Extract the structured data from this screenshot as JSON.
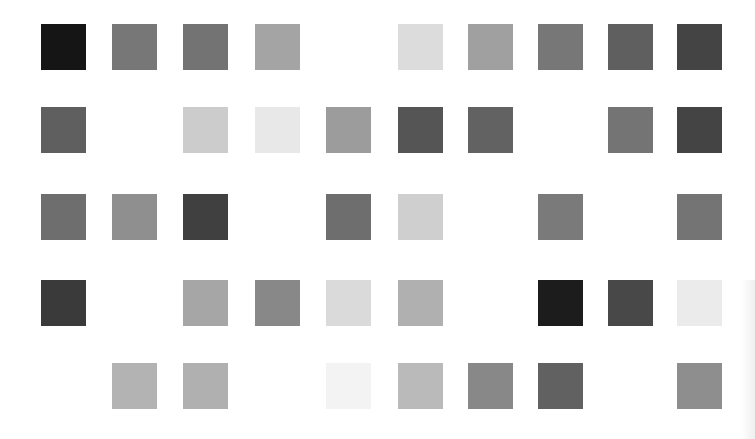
{
  "grid": {
    "rows": 5,
    "cols": 10,
    "cell_size": 45,
    "col_x": [
      41,
      112,
      183,
      255,
      326,
      398,
      468,
      538,
      608,
      677
    ],
    "row_y": [
      24,
      107,
      194,
      280,
      363
    ],
    "cells": [
      [
        "#151515",
        "#777777",
        "#737373",
        "#a4a4a4",
        null,
        "#dcdcdc",
        "#a0a0a0",
        "#777777",
        "#5f5f5f",
        "#444444"
      ],
      [
        "#5f5f5f",
        null,
        "#cccccc",
        "#e8e8e8",
        "#9c9c9c",
        "#555555",
        "#626262",
        null,
        "#747474",
        "#444444"
      ],
      [
        "#6e6e6e",
        "#8f8f8f",
        "#404040",
        null,
        "#6e6e6e",
        "#cfcfcf",
        null,
        "#7a7a7a",
        null,
        "#747474"
      ],
      [
        "#3a3a3a",
        null,
        "#a6a6a6",
        "#888888",
        "#dadada",
        "#b0b0b0",
        null,
        "#1c1c1c",
        "#484848",
        "#ebebeb"
      ],
      [
        null,
        "#b3b3b3",
        "#b0b0b0",
        null,
        "#f3f3f3",
        "#bababa",
        "#888888",
        "#616161",
        null,
        "#8e8e8e"
      ]
    ]
  }
}
